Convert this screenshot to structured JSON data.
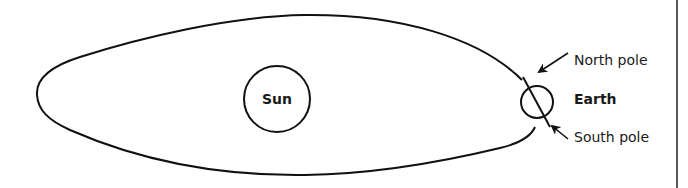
{
  "diagram": {
    "type": "earth-orbit-around-sun",
    "sun": {
      "label": "Sun"
    },
    "earth": {
      "label": "Earth"
    },
    "annotations": {
      "north_pole": "North pole",
      "south_pole": "South pole"
    },
    "colors": {
      "stroke": "#111111",
      "background": "#ffffff",
      "text": "#1a1a1a"
    }
  }
}
